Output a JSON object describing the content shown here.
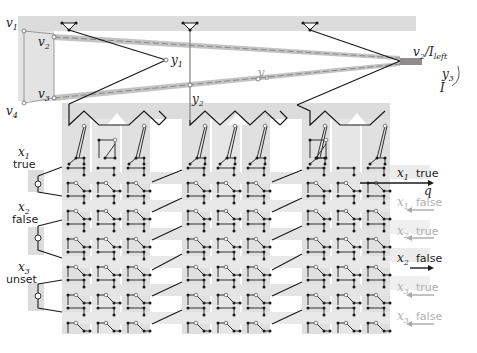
{
  "figure": {
    "type": "gadget-construction-diagram",
    "colors": {
      "band": "#dcdcdc",
      "band_light": "#e8e8e8",
      "dark_edge": "#1a1a1a",
      "grey_edge": "#777777",
      "highlight_band": "#bdbdbd",
      "faded_text": "#b0b0b0"
    },
    "top_labels": {
      "v1": "v",
      "v1_sub": "1",
      "v2": "v",
      "v2_sub": "2",
      "v3": "v",
      "v3_sub": "3",
      "v4": "v",
      "v4_sub": "4",
      "y1": "y",
      "y1_sub": "1",
      "y2": "y",
      "y2_sub": "2",
      "y3": "y",
      "y3_sub": "3",
      "v3_mid": "v",
      "v3_mid_sub": "3",
      "right_v2": "v",
      "right_v2_sub": "2",
      "slash": "/",
      "I_left": "I",
      "I_left_sub": "left",
      "I": "I",
      "q": "q"
    },
    "variables": [
      {
        "name": "x",
        "sub": "1",
        "state": "true"
      },
      {
        "name": "x",
        "sub": "2",
        "state": "false"
      },
      {
        "name": "x",
        "sub": "3",
        "state": "unset"
      }
    ],
    "outputs": [
      {
        "name": "x",
        "sub": "1",
        "state": "true",
        "active": true,
        "arrow": "right"
      },
      {
        "name": "x",
        "sub": "1",
        "state": "false",
        "active": false,
        "arrow": "left"
      },
      {
        "name": "x",
        "sub": "2",
        "state": "true",
        "active": false,
        "arrow": "left"
      },
      {
        "name": "x",
        "sub": "2",
        "state": "false",
        "active": true,
        "arrow": "right"
      },
      {
        "name": "x",
        "sub": "3",
        "state": "true",
        "active": false,
        "arrow": "left"
      },
      {
        "name": "x",
        "sub": "3",
        "state": "false",
        "active": false,
        "arrow": "left"
      }
    ]
  }
}
